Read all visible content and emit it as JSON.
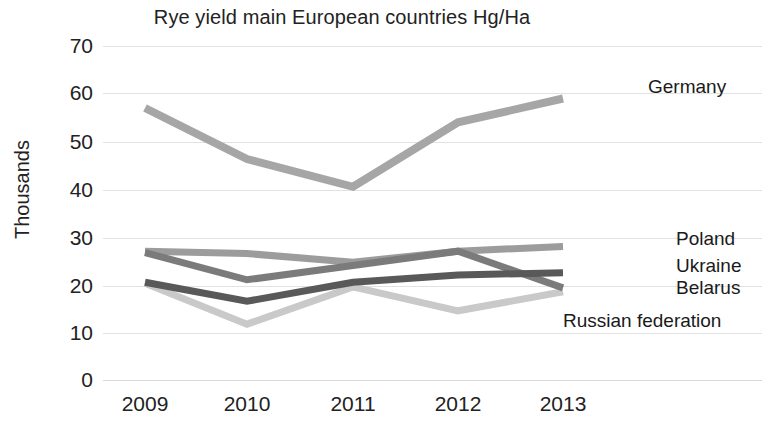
{
  "chart_data": {
    "type": "line",
    "title": "Rye yield main European countries Hg/Ha",
    "xlabel": "",
    "ylabel": "Thousands",
    "categories": [
      "2009",
      "2010",
      "2011",
      "2012",
      "2013"
    ],
    "ylim": [
      0,
      70
    ],
    "yticks": [
      "0",
      "10",
      "20",
      "30",
      "40",
      "50",
      "60",
      "70"
    ],
    "grid": true,
    "legend_position": "right-of-line-ends",
    "series": [
      {
        "name": "Germany",
        "color": "#a6a6a6",
        "values": [
          57.0,
          46.3,
          40.5,
          54.0,
          59.0
        ]
      },
      {
        "name": "Poland",
        "color": "#9c9c9c",
        "values": [
          27.0,
          26.5,
          24.7,
          27.0,
          28.0
        ]
      },
      {
        "name": "Ukraine",
        "color": "#7b7b7b",
        "values": [
          26.7,
          21.0,
          24.0,
          27.0,
          19.3
        ]
      },
      {
        "name": "Belarus",
        "color": "#595959",
        "values": [
          20.5,
          16.5,
          20.5,
          22.0,
          22.5
        ]
      },
      {
        "name": "Russian federation",
        "color": "#c9c9c9",
        "values": [
          20.3,
          11.7,
          19.5,
          14.5,
          18.5
        ]
      }
    ]
  },
  "labels": {
    "germany": "Germany",
    "poland": "Poland",
    "ukraine": "Ukraine",
    "belarus": "Belarus",
    "russian_federation": "Russian federation"
  },
  "yticks": {
    "t0": "0",
    "t10": "10",
    "t20": "20",
    "t30": "30",
    "t40": "40",
    "t50": "50",
    "t60": "60",
    "t70": "70"
  },
  "xticks": {
    "x2009": "2009",
    "x2010": "2010",
    "x2011": "2011",
    "x2012": "2012",
    "x2013": "2013"
  }
}
